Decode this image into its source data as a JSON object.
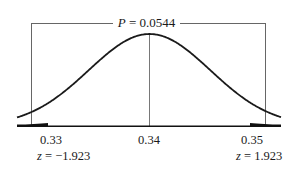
{
  "chart_data": {
    "type": "area",
    "title": "P = 0.0544",
    "title_var": "P",
    "title_value": "0.0544",
    "distribution": "normal",
    "mean": 0.34,
    "x_ticks": [
      "0.33",
      "0.34",
      "0.35"
    ],
    "z_labels": [
      {
        "x": 0.33,
        "var": "z",
        "value": "−1.923"
      },
      {
        "x": 0.35,
        "var": "z",
        "value": "1.923"
      }
    ],
    "shaded_regions": [
      {
        "from": "-inf",
        "to": 0.33,
        "label": "left tail"
      },
      {
        "from": 0.35,
        "to": "inf",
        "label": "right tail"
      }
    ],
    "two_tailed_p_value": 0.0544,
    "xlabel": "",
    "ylabel": "",
    "grid": false,
    "legend": "none"
  },
  "labels": {
    "p_var": "P",
    "p_eq": " = 0.0544",
    "tick_left": "0.33",
    "tick_mid": "0.34",
    "tick_right": "0.35",
    "z_left_var": "z",
    "z_left_eq": " = −1.923",
    "z_right_var": "z",
    "z_right_eq": " = 1.923"
  },
  "colors": {
    "line": "#1a1a1a",
    "bracket": "#555555",
    "shade": "#111111"
  }
}
